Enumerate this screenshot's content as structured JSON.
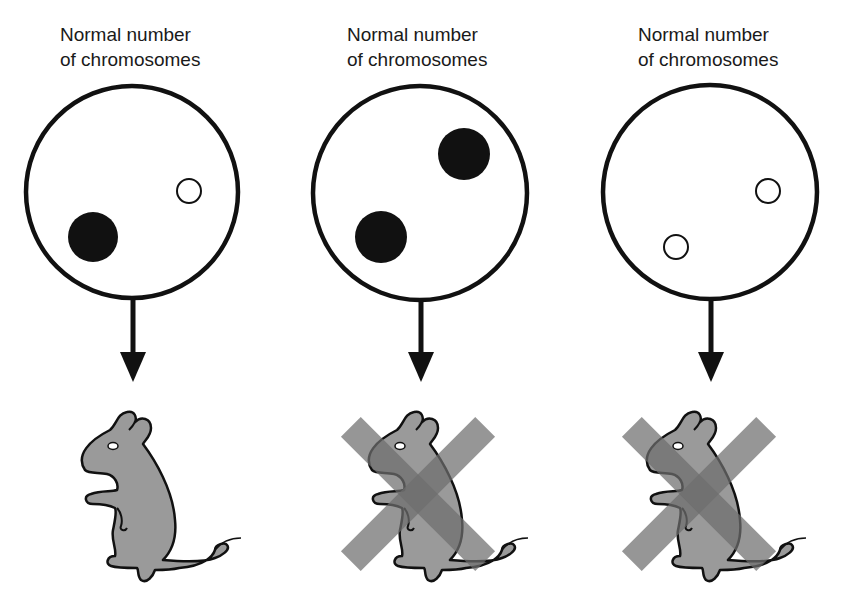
{
  "panels": [
    {
      "id": "panel-1",
      "label_line1": "Normal number",
      "label_line2": "of chromosomes",
      "chromosomes": [
        {
          "type": "filled",
          "cx": 93,
          "cy": 237,
          "r": 25
        },
        {
          "type": "hollow",
          "cx": 189,
          "cy": 191,
          "r": 12
        }
      ],
      "outcome": "viable mouse",
      "crossed_out": false
    },
    {
      "id": "panel-2",
      "label_line1": "Normal number",
      "label_line2": "of chromosomes",
      "chromosomes": [
        {
          "type": "filled",
          "cx": 381,
          "cy": 237,
          "r": 26
        },
        {
          "type": "filled",
          "cx": 464,
          "cy": 154,
          "r": 26
        }
      ],
      "outcome": "non-viable mouse",
      "crossed_out": true
    },
    {
      "id": "panel-3",
      "label_line1": "Normal number",
      "label_line2": "of chromosomes",
      "chromosomes": [
        {
          "type": "hollow",
          "cx": 676,
          "cy": 247,
          "r": 12
        },
        {
          "type": "hollow",
          "cx": 768,
          "cy": 191,
          "r": 12
        }
      ],
      "outcome": "non-viable mouse",
      "crossed_out": true
    }
  ],
  "colors": {
    "outline": "#111111",
    "mouse_fill": "#9a9a9a",
    "cross_fill": "#6e6e6e",
    "background": "#ffffff"
  }
}
